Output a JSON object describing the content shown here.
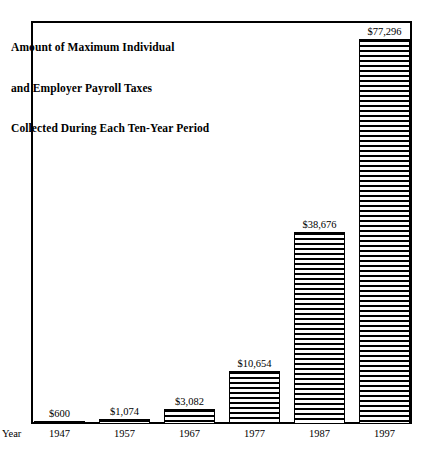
{
  "chart_data": {
    "type": "bar",
    "title": "Amount of Maximum Individual and Employer Payroll Taxes Collected During Each Ten-Year Period",
    "title_lines": [
      "Amount of Maximum Individual",
      "and Employer Payroll Taxes",
      "Collected During Each Ten-Year Period"
    ],
    "xlabel": "Year",
    "ylabel": "",
    "categories": [
      "1947",
      "1957",
      "1967",
      "1977",
      "1987",
      "1997"
    ],
    "values": [
      600,
      1074,
      3082,
      10654,
      38676,
      77296
    ],
    "value_labels": [
      "$600",
      "$1,074",
      "$3,082",
      "$10,654",
      "$38,676",
      "$77,296"
    ],
    "ylim": [
      0,
      81000
    ],
    "grid": false,
    "legend": null,
    "bar_fill": "horizontal-hatch",
    "bar_outline_color": "#000000",
    "background_color": "#ffffff",
    "frame": true
  },
  "axis": {
    "year_label": "Year"
  }
}
